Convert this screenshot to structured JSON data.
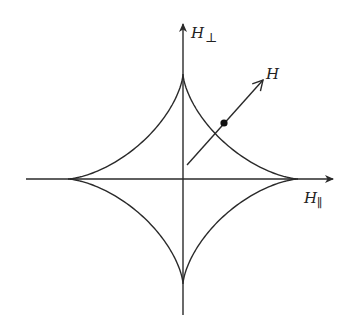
{
  "diagram": {
    "type": "stoner-wohlfarth-astroid",
    "colors": {
      "stroke": "#2a2a2a",
      "background": "#ffffff"
    },
    "labels": {
      "vertical_axis": "H",
      "vertical_axis_subscript": "⊥",
      "horizontal_axis": "H",
      "horizontal_axis_subscript": "∥",
      "field_vector": "H"
    },
    "elements": [
      "horizontal-axis",
      "vertical-axis",
      "astroid-curve",
      "field-vector-arrow",
      "field-point"
    ]
  }
}
